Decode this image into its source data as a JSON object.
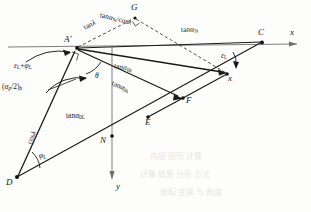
{
  "figure": {
    "type": "geometric-vector-diagram",
    "background": "#fdfdfb",
    "ink": "#1a1a1a"
  },
  "axes": {
    "x_label": "x",
    "y_label": "y"
  },
  "points": [
    {
      "name": "A-prime",
      "label": "A'",
      "x": 70,
      "y": 48
    },
    {
      "name": "G",
      "label": "G",
      "x": 136,
      "y": 12
    },
    {
      "name": "C",
      "label": "C",
      "x": 262,
      "y": 42
    },
    {
      "name": "x-axis-tip",
      "label": "x",
      "x": 300,
      "y": 44
    },
    {
      "name": "F",
      "label": "F",
      "x": 228,
      "y": 74
    },
    {
      "name": "E",
      "label": "E",
      "x": 183,
      "y": 98
    },
    {
      "name": "N",
      "label": "N",
      "x": 148,
      "y": 118
    },
    {
      "name": "D",
      "label": "D",
      "x": 80,
      "y": 140
    },
    {
      "name": "B",
      "label": "B",
      "x": 16,
      "y": 178
    },
    {
      "name": "y-axis-tip",
      "label": "y",
      "x": 116,
      "y": 188
    }
  ],
  "labels": {
    "tan_lambda": "tanλ",
    "tan_alpha_N_over_cos_lambda": "tanαN/cosλ",
    "tan_alpha_N": "tanαN",
    "tan_alpha_0k_upper": "tanα₀k",
    "tan_alpha_0k_lower": "tanα₀k",
    "tan_alpha_0L": "tanα₀L",
    "cos_lambda": "cosλ",
    "epsilon_plus_phi": "εL+φL",
    "alpha_p_over_2_h": "(αp/2)h",
    "theta": "θ",
    "epsilon_L": "εL",
    "phi_L": "φL"
  },
  "label_parts": {
    "tan_lambda": {
      "fn": "tan",
      "arg": "λ"
    },
    "tan_alpha_N_num": {
      "fn": "tan",
      "sym": "α",
      "sub": "N"
    },
    "cos_lambda_den": {
      "fn": "cos",
      "arg": "λ"
    },
    "alpha": "α",
    "epsilon": "ε",
    "phi": "φ",
    "theta": "θ",
    "lambda": "λ",
    "sub_N": "N",
    "sub_0k": "0k",
    "sub_0L": "0L",
    "sub_L": "L",
    "sub_h": "h",
    "sub_p": "p",
    "half": "/2"
  },
  "ghost_text": {
    "row1": "内容 图形 计算",
    "row2": "计算 结果 分析 方法",
    "row3": "坐标 变换 与 角度"
  }
}
